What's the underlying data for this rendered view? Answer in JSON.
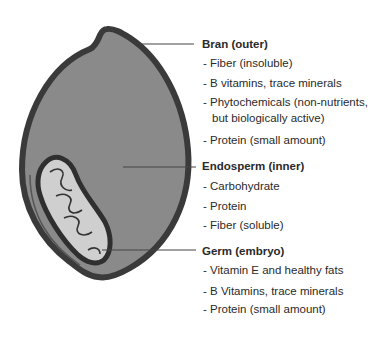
{
  "diagram": {
    "colors": {
      "outline": "#3a3a3a",
      "endosperm": "#8a8a8a",
      "germ": "#cfcfcf",
      "leader": "#444444",
      "text": "#2a2a2a"
    },
    "sections": [
      {
        "heading": "Bran (outer)",
        "items": [
          "- Fiber (insoluble)",
          "- B vitamins, trace minerals",
          "- Phytochemicals (non-nutrients,",
          "but biologically active)",
          "- Protein (small amount)"
        ]
      },
      {
        "heading": "Endosperm (inner)",
        "items": [
          "- Carbohydrate",
          "- Protein",
          "- Fiber (soluble)"
        ]
      },
      {
        "heading": "Germ (embryo)",
        "items": [
          "- Vitamin E and healthy fats",
          "- B Vitamins, trace minerals",
          "- Protein (small amount)"
        ]
      }
    ]
  }
}
